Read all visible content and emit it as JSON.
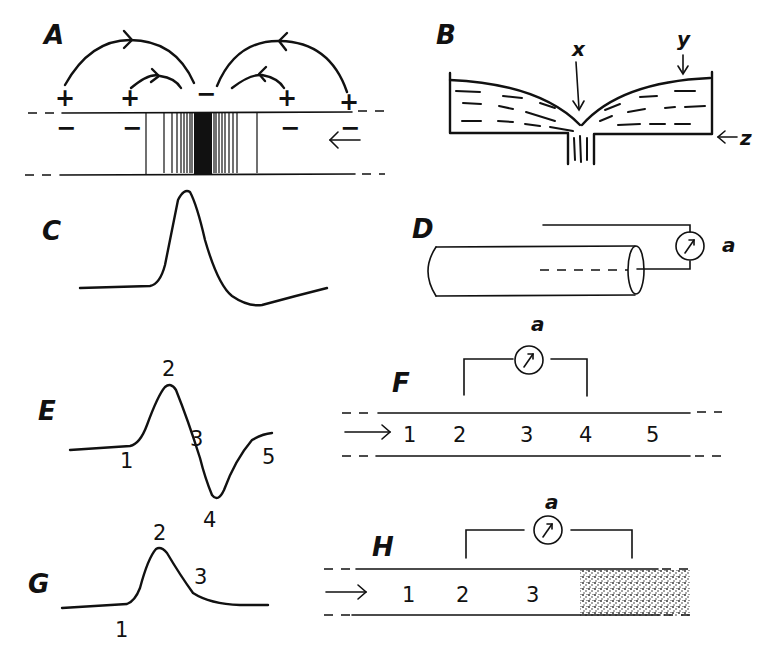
{
  "figure": {
    "panels": {
      "A": {
        "label": "A",
        "top_charges": [
          "+",
          "+",
          "−",
          "+",
          "+"
        ],
        "inner_charges": [
          "−",
          "−",
          "−",
          "−"
        ],
        "arrow": "←"
      },
      "B": {
        "label": "B",
        "markers": {
          "x": "x",
          "y": "y",
          "z": "z"
        },
        "z_arrow": "←"
      },
      "C": {
        "label": "C"
      },
      "D": {
        "label": "D",
        "meter": "a"
      },
      "E": {
        "label": "E",
        "points": [
          "1",
          "2",
          "3",
          "4",
          "5"
        ]
      },
      "F": {
        "label": "F",
        "meter": "a",
        "arrow": "→",
        "positions": [
          "1",
          "2",
          "3",
          "4",
          "5"
        ]
      },
      "G": {
        "label": "G",
        "points": [
          "1",
          "2",
          "3"
        ]
      },
      "H": {
        "label": "H",
        "meter": "a",
        "arrow": "→",
        "positions": [
          "1",
          "2",
          "3"
        ]
      }
    }
  },
  "colors": {
    "ink": "#111111",
    "background": "#ffffff"
  }
}
